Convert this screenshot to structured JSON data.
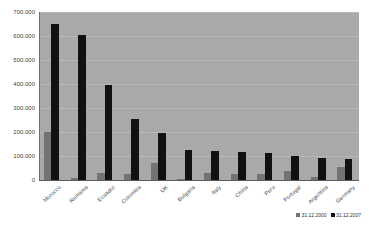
{
  "chart_data": {
    "type": "bar",
    "title": "",
    "xlabel": "",
    "ylabel": "",
    "ylim": [
      0,
      700000
    ],
    "grid": true,
    "legend_position": "bottom-right",
    "categories": [
      "Morocco",
      "Romania",
      "Ecuador",
      "Colombia",
      "UK",
      "Bulgaria",
      "Italy",
      "China",
      "Peru",
      "Portugal",
      "Argentina",
      "Germany"
    ],
    "tick_labels": [
      "0",
      "100.000",
      "200.000",
      "300.000",
      "400.000",
      "500.000",
      "600.000",
      "700.000"
    ],
    "tick_values": [
      0,
      100000,
      200000,
      300000,
      400000,
      500000,
      600000,
      700000
    ],
    "series": [
      {
        "name": "31.12.2000",
        "color": "#737373",
        "values": [
          200000,
          8000,
          30000,
          23000,
          72000,
          5000,
          28000,
          25000,
          25000,
          38000,
          13000,
          55000
        ]
      },
      {
        "name": "31.12.2007",
        "color": "#111111",
        "values": [
          650000,
          605000,
          397000,
          253000,
          196000,
          125000,
          122000,
          117000,
          113000,
          99000,
          93000,
          88000
        ]
      }
    ]
  },
  "colors": {
    "plot_background": "#a9a9a9",
    "gridline": "#b8b8b8",
    "page_background": "#ffffff",
    "series_2000": "#737373",
    "series_2007": "#111111"
  }
}
